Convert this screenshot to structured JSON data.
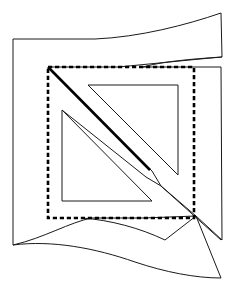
{
  "figure": {
    "caption": "",
    "canvas": {
      "width": 233,
      "height": 284,
      "background": "#ffffff"
    },
    "colors": {
      "stroke_thin": "#1a1a1a",
      "stroke_thick": "#000000",
      "dashed": "#000000",
      "background": "#ffffff"
    },
    "shapes": [
      {
        "name": "outer-sheet-outline",
        "kind": "closed-path",
        "stroke": "#1a1a1a",
        "stroke_width": 1,
        "style": "solid",
        "description": "Outer curved sheet silhouette: left vertical edge, top flap curving up to the right, right vertical edge, bottom flap curving down to a point at lower right",
        "path": "M 13 39 L 95 39 C 140 37 186 25 221 13 L 222 57 C 190 59 160 62 143 67 L 194 67 L 221 67 L 222 240 L 196 216 L 143 218 L 92 218 C 70 222 44 238 13 245 L 13 39 Z"
      },
      {
        "name": "top-flap-inner-fold",
        "kind": "open-path",
        "stroke": "#1a1a1a",
        "stroke_width": 1,
        "style": "solid",
        "description": "Inner fold line of the top flap running from the dashed square's top-left corner rightwards and curving up to the right edge",
        "path": "M 48 67 L 118 67 C 150 64 188 60 222 57"
      },
      {
        "name": "bottom-flap-inner-fold",
        "kind": "open-path",
        "stroke": "#1a1a1a",
        "stroke_width": 1,
        "style": "solid",
        "description": "Inner fold line of the bottom flap starting near the dashed square's bottom edge and curving down-right to the tail point",
        "path": "M 82 218 C 110 220 140 228 165 240 L 196 216"
      },
      {
        "name": "bottom-tail-lower-edge",
        "kind": "open-path",
        "stroke": "#1a1a1a",
        "stroke_width": 1,
        "style": "solid",
        "description": "Lower boundary of the pointed bottom tail sweeping from the left edge to the sharp point at lower right",
        "path": "M 13 245 C 52 240 95 248 135 262 C 165 272 195 278 221 278 L 196 216"
      },
      {
        "name": "dashed-square",
        "kind": "rectangle",
        "stroke": "#000000",
        "stroke_width": 2.6,
        "style": "dashed",
        "dash_pattern": "4.2 2.8",
        "description": "Dashed square outline marking the fold/cut boundary",
        "x": 48,
        "y": 67,
        "width": 146,
        "height": 151
      },
      {
        "name": "thick-diagonal",
        "kind": "line",
        "stroke": "#000000",
        "stroke_width": 2.6,
        "style": "solid",
        "description": "Heavy diagonal crease running from the dashed square's top-left corner down toward the lower right, fading past the center",
        "x1": 48,
        "y1": 67,
        "x2": 150,
        "y2": 170
      },
      {
        "name": "upper-right-triangle",
        "kind": "closed-path",
        "stroke": "#1a1a1a",
        "stroke_width": 1,
        "style": "solid",
        "description": "Upper right triangle with horizontal top edge, vertical right edge and hypotenuse descending left-to-right toward the center",
        "path": "M 88 85 L 178 85 L 178 175 Z"
      },
      {
        "name": "lower-left-triangle",
        "kind": "closed-path",
        "stroke": "#1a1a1a",
        "stroke_width": 1,
        "style": "solid",
        "description": "Lower left triangle with vertical left edge, horizontal bottom edge and hypotenuse from top-left down to bottom-right",
        "path": "M 62 110 L 152 201 L 62 201 Z"
      },
      {
        "name": "diagonal-band-upper-edge",
        "kind": "open-path",
        "stroke": "#1a1a1a",
        "stroke_width": 1,
        "style": "solid",
        "description": "Upper edge of the thin diagonal band extending from the mid-left through a kink near centre down to the lower right point",
        "path": "M 48 67 L 152 171 L 161 186 L 221 240"
      },
      {
        "name": "diagonal-band-lower-edge",
        "kind": "open-path",
        "stroke": "#1a1a1a",
        "stroke_width": 1,
        "style": "solid",
        "description": "Lower edge of the thin diagonal band running parallel below the upper edge and meeting it at the kink",
        "path": "M 62 110 L 146 177 L 161 186 L 196 216"
      }
    ]
  }
}
